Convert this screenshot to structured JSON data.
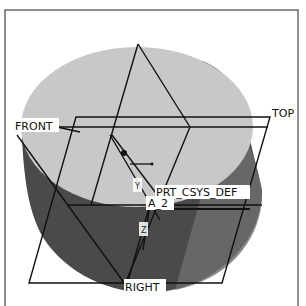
{
  "viewport": {
    "background": "#ffffff",
    "frame_color": "#666666"
  },
  "model": {
    "type": "cylinder",
    "top_face_color": "#c9c9c9",
    "side_color_light": "#7a7a7a",
    "side_color_dark": "#3f3f3f"
  },
  "datum_planes": [
    {
      "id": "front",
      "label": "FRONT"
    },
    {
      "id": "top",
      "label": "TOP"
    },
    {
      "id": "right",
      "label": "RIGHT"
    }
  ],
  "coordinate_system": {
    "label": "PRT_CSYS_DEF",
    "axis_label": "A_2",
    "axis_labels": {
      "x": "X",
      "y": "Y",
      "z": "Z"
    }
  },
  "colors": {
    "line": "#111111",
    "label_bg": "#ffffff"
  }
}
